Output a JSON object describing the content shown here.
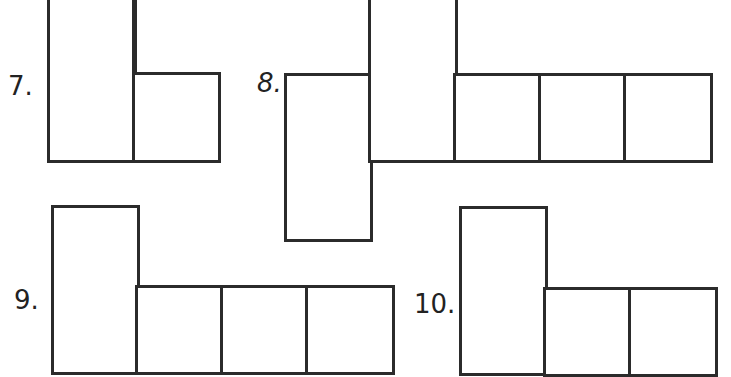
{
  "worksheet": {
    "problems": [
      {
        "number": "7.",
        "label_pos": [
          8,
          73
        ],
        "cells": [
          {
            "x": 47,
            "y": -10,
            "w": 90,
            "h": 173
          },
          {
            "x": 132,
            "y": -10,
            "w": 5,
            "h": 88
          },
          {
            "x": 132,
            "y": 72,
            "w": 89,
            "h": 91
          }
        ]
      },
      {
        "number": "8.",
        "label_pos": [
          257,
          70
        ],
        "cells": [
          {
            "x": 284,
            "y": 73,
            "w": 89,
            "h": 169
          },
          {
            "x": 368,
            "y": -10,
            "w": 90,
            "h": 173
          },
          {
            "x": 453,
            "y": 73,
            "w": 89,
            "h": 90
          },
          {
            "x": 538,
            "y": 73,
            "w": 90,
            "h": 90
          },
          {
            "x": 623,
            "y": 73,
            "w": 90,
            "h": 90
          }
        ]
      },
      {
        "number": "9.",
        "label_pos": [
          14,
          287
        ],
        "cells": [
          {
            "x": 51,
            "y": 205,
            "w": 89,
            "h": 170
          },
          {
            "x": 135,
            "y": 285,
            "w": 90,
            "h": 90
          },
          {
            "x": 220,
            "y": 285,
            "w": 90,
            "h": 90
          },
          {
            "x": 305,
            "y": 285,
            "w": 90,
            "h": 90
          }
        ]
      },
      {
        "number": "10.",
        "label_pos": [
          414,
          291
        ],
        "cells": [
          {
            "x": 459,
            "y": 206,
            "w": 89,
            "h": 170
          },
          {
            "x": 543,
            "y": 287,
            "w": 90,
            "h": 90
          },
          {
            "x": 628,
            "y": 287,
            "w": 90,
            "h": 90
          }
        ]
      }
    ]
  }
}
